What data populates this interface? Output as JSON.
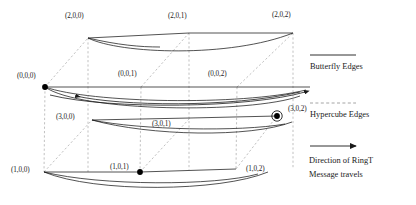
{
  "figure": {
    "type": "network-topology-diagram"
  },
  "colors": {
    "butterfly_edge": "#1a1a1a",
    "hypercube_edge": "#9a9a9a",
    "node_fill": "#000000",
    "background": "#ffffff",
    "text": "#1a1a1a"
  },
  "nodes": [
    {
      "id": "n200",
      "label": "(2,0,0)",
      "x": 88,
      "y": 38,
      "label_x": 65,
      "label_y": 12,
      "marked": false,
      "circled": false
    },
    {
      "id": "n201",
      "label": "(2,0,1)",
      "x": 189,
      "y": 33,
      "label_x": 168,
      "label_y": 12,
      "marked": false,
      "circled": false
    },
    {
      "id": "n202",
      "label": "(2,0,2)",
      "x": 293,
      "y": 33,
      "label_x": 272,
      "label_y": 11,
      "marked": false,
      "circled": false
    },
    {
      "id": "n000",
      "label": "(0,0,0)",
      "x": 45,
      "y": 87,
      "label_x": 17,
      "label_y": 72,
      "marked": true,
      "circled": false
    },
    {
      "id": "n001",
      "label": "(0,0,1)",
      "x": 141,
      "y": 87,
      "label_x": 118,
      "label_y": 70,
      "marked": false,
      "circled": false
    },
    {
      "id": "n002",
      "label": "(0,0,2)",
      "x": 237,
      "y": 87,
      "label_x": 208,
      "label_y": 70,
      "marked": false,
      "circled": false
    },
    {
      "id": "n300",
      "label": "(3,0,0)",
      "x": 92,
      "y": 120,
      "label_x": 56,
      "label_y": 113,
      "marked": false,
      "circled": false
    },
    {
      "id": "n301",
      "label": "(3,0,1)",
      "x": 190,
      "y": 118,
      "label_x": 152,
      "label_y": 120,
      "marked": false,
      "circled": false
    },
    {
      "id": "n302",
      "label": "(3,0,2)",
      "x": 277,
      "y": 116,
      "label_x": 288,
      "label_y": 105,
      "marked": true,
      "circled": true
    },
    {
      "id": "n100",
      "label": "(1,0,0)",
      "x": 44,
      "y": 172,
      "label_x": 11,
      "label_y": 166,
      "marked": false,
      "circled": false
    },
    {
      "id": "n101",
      "label": "(1,0,1)",
      "x": 140,
      "y": 172,
      "label_x": 110,
      "label_y": 163,
      "marked": true,
      "circled": false
    },
    {
      "id": "n102",
      "label": "(1,0,2)",
      "x": 236,
      "y": 168,
      "label_x": 246,
      "label_y": 165,
      "marked": false,
      "circled": false
    }
  ],
  "legend": {
    "items": [
      {
        "key": "butterfly",
        "style": "solid",
        "label": "Butterfly Edges",
        "label_x": 310,
        "label_y": 62,
        "swatch_y": 55
      },
      {
        "key": "hypercube",
        "style": "dashed",
        "label": "Hypercube Edges",
        "label_x": 310,
        "label_y": 110,
        "swatch_y": 103
      },
      {
        "key": "ring",
        "style": "arrow",
        "label": "Direction of RingT",
        "label_x": 309,
        "label_y": 156,
        "swatch_y": 146
      },
      {
        "key": "ring2",
        "style": "none",
        "label": "Message travels",
        "label_x": 309,
        "label_y": 170,
        "swatch_y": 0
      }
    ]
  }
}
